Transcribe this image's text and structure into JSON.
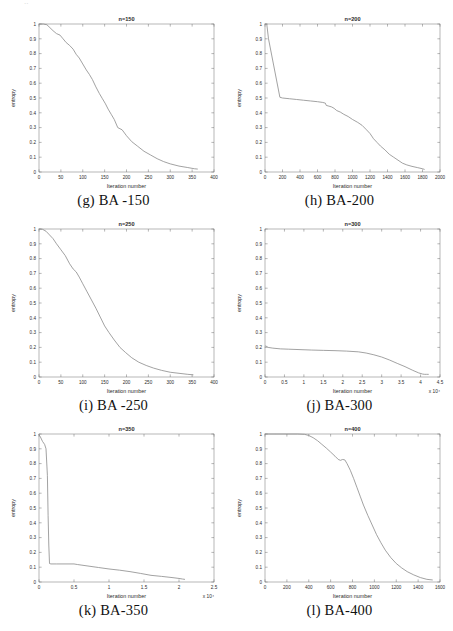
{
  "figure": {
    "artifact_text": "..",
    "panel_count": 6
  },
  "panels": [
    {
      "id": "g",
      "caption": "(g) BA -150",
      "title": "n=150",
      "xlabel": "Iteration number",
      "ylabel": "entropy",
      "x_exponent": "",
      "xticks": [
        "0",
        "50",
        "100",
        "150",
        "200",
        "250",
        "300",
        "350",
        "400"
      ],
      "yticks": [
        "0",
        "0.1",
        "0.2",
        "0.3",
        "0.4",
        "0.5",
        "0.6",
        "0.7",
        "0.8",
        "0.9",
        "1"
      ],
      "xlim": [
        0,
        400
      ],
      "ylim": [
        0,
        1
      ]
    },
    {
      "id": "h",
      "caption": "(h) BA-200",
      "title": "n=200",
      "xlabel": "Iteration number",
      "ylabel": "entropy",
      "x_exponent": "",
      "xticks": [
        "0",
        "200",
        "400",
        "600",
        "800",
        "1000",
        "1200",
        "1400",
        "1600",
        "1800",
        "2000"
      ],
      "yticks": [
        "0",
        "0.1",
        "0.2",
        "0.3",
        "0.4",
        "0.5",
        "0.6",
        "0.7",
        "0.8",
        "0.9",
        "1"
      ],
      "xlim": [
        0,
        2000
      ],
      "ylim": [
        0,
        1
      ]
    },
    {
      "id": "i",
      "caption": "(i) BA -250",
      "title": "n=250",
      "xlabel": "Iteration number",
      "ylabel": "entropy",
      "x_exponent": "",
      "xticks": [
        "0",
        "50",
        "100",
        "150",
        "200",
        "250",
        "300",
        "350",
        "400"
      ],
      "yticks": [
        "0",
        "0.1",
        "0.2",
        "0.3",
        "0.4",
        "0.5",
        "0.6",
        "0.7",
        "0.8",
        "0.9",
        "1"
      ],
      "xlim": [
        0,
        400
      ],
      "ylim": [
        0,
        1
      ]
    },
    {
      "id": "j",
      "caption": "(j) BA-300",
      "title": "n=300",
      "xlabel": "Iteration number",
      "ylabel": "entropy",
      "x_exponent": "x 10⁴",
      "xticks": [
        "0",
        "0.5",
        "1",
        "1.5",
        "2",
        "2.5",
        "3",
        "3.5",
        "4",
        "4.5"
      ],
      "yticks": [
        "0",
        "0.1",
        "0.2",
        "0.3",
        "0.4",
        "0.5",
        "0.6",
        "0.7",
        "0.8",
        "0.9",
        "1"
      ],
      "xlim": [
        0,
        4.5
      ],
      "ylim": [
        0,
        1
      ]
    },
    {
      "id": "k",
      "caption": "(k) BA-350",
      "title": "n=350",
      "xlabel": "Iteration number",
      "ylabel": "entropy",
      "x_exponent": "x 10⁴",
      "xticks": [
        "0",
        "0.5",
        "1",
        "1.5",
        "2",
        "2.5"
      ],
      "yticks": [
        "0",
        "0.1",
        "0.2",
        "0.3",
        "0.4",
        "0.5",
        "0.6",
        "0.7",
        "0.8",
        "0.9",
        "1"
      ],
      "xlim": [
        0,
        2.5
      ],
      "ylim": [
        0,
        1
      ]
    },
    {
      "id": "l",
      "caption": "(l) BA-400",
      "title": "n=400",
      "xlabel": "Iteration number",
      "ylabel": "entropy",
      "x_exponent": "",
      "xticks": [
        "0",
        "200",
        "400",
        "600",
        "800",
        "1000",
        "1200",
        "1400",
        "1600"
      ],
      "yticks": [
        "0",
        "0.1",
        "0.2",
        "0.3",
        "0.4",
        "0.5",
        "0.6",
        "0.7",
        "0.8",
        "0.9",
        "1"
      ],
      "xlim": [
        0,
        1600
      ],
      "ylim": [
        0,
        1
      ]
    }
  ],
  "chart_data": [
    {
      "type": "line",
      "panel": "g",
      "title": "n=150",
      "xlabel": "Iteration number",
      "ylabel": "entropy",
      "xlim": [
        0,
        400
      ],
      "ylim": [
        0,
        1
      ],
      "grid": false,
      "legend": null,
      "series": [
        {
          "name": "entropy",
          "x": [
            0,
            10,
            18,
            25,
            32,
            40,
            48,
            55,
            62,
            70,
            78,
            85,
            92,
            100,
            108,
            115,
            122,
            130,
            138,
            145,
            152,
            158,
            165,
            172,
            180,
            190,
            200,
            212,
            225,
            240,
            255,
            270,
            285,
            300,
            320,
            340,
            355,
            362
          ],
          "y": [
            1.0,
            1.0,
            0.995,
            0.975,
            0.955,
            0.935,
            0.925,
            0.9,
            0.875,
            0.855,
            0.83,
            0.795,
            0.77,
            0.73,
            0.69,
            0.66,
            0.625,
            0.575,
            0.53,
            0.495,
            0.46,
            0.425,
            0.39,
            0.355,
            0.3,
            0.285,
            0.245,
            0.205,
            0.175,
            0.14,
            0.115,
            0.09,
            0.07,
            0.055,
            0.04,
            0.03,
            0.022,
            0.02
          ]
        }
      ]
    },
    {
      "type": "line",
      "panel": "h",
      "title": "n=200",
      "xlabel": "Iteration number",
      "ylabel": "entropy",
      "xlim": [
        0,
        2000
      ],
      "ylim": [
        0,
        1
      ],
      "grid": false,
      "legend": null,
      "series": [
        {
          "name": "entropy",
          "x": [
            0,
            20,
            40,
            170,
            200,
            280,
            360,
            440,
            520,
            600,
            660,
            690,
            700,
            730,
            760,
            790,
            820,
            860,
            900,
            950,
            1000,
            1060,
            1110,
            1160,
            1200,
            1240,
            1280,
            1320,
            1370,
            1420,
            1470,
            1520,
            1570,
            1620,
            1680,
            1740,
            1800,
            1820
          ],
          "y": [
            1.0,
            1.0,
            0.9,
            0.505,
            0.5,
            0.495,
            0.49,
            0.485,
            0.48,
            0.475,
            0.47,
            0.465,
            0.45,
            0.445,
            0.44,
            0.43,
            0.415,
            0.405,
            0.39,
            0.375,
            0.355,
            0.335,
            0.315,
            0.285,
            0.26,
            0.225,
            0.2,
            0.175,
            0.15,
            0.12,
            0.1,
            0.08,
            0.06,
            0.048,
            0.038,
            0.03,
            0.022,
            0.018
          ]
        }
      ]
    },
    {
      "type": "line",
      "panel": "i",
      "title": "n=250",
      "xlabel": "Iteration number",
      "ylabel": "entropy",
      "xlim": [
        0,
        400
      ],
      "ylim": [
        0,
        1
      ],
      "grid": false,
      "legend": null,
      "series": [
        {
          "name": "entropy",
          "x": [
            0,
            8,
            16,
            24,
            32,
            40,
            50,
            60,
            70,
            78,
            85,
            92,
            100,
            110,
            120,
            130,
            140,
            150,
            160,
            172,
            185,
            198,
            212,
            228,
            245,
            262,
            280,
            300,
            320,
            340,
            352
          ],
          "y": [
            1.0,
            0.998,
            0.985,
            0.96,
            0.935,
            0.9,
            0.86,
            0.82,
            0.765,
            0.73,
            0.71,
            0.675,
            0.63,
            0.575,
            0.52,
            0.465,
            0.405,
            0.345,
            0.3,
            0.25,
            0.2,
            0.165,
            0.13,
            0.1,
            0.078,
            0.06,
            0.045,
            0.032,
            0.025,
            0.018,
            0.015
          ]
        }
      ]
    },
    {
      "type": "line",
      "panel": "j",
      "title": "n=300",
      "xlabel": "Iteration number",
      "ylabel": "entropy",
      "xlim": [
        0,
        4.5
      ],
      "ylim": [
        0,
        1
      ],
      "grid": false,
      "legend": null,
      "note": "x axis in units of 10^4",
      "series": [
        {
          "name": "entropy",
          "x": [
            0,
            0.02,
            0.08,
            0.2,
            0.4,
            0.6,
            0.9,
            1.2,
            1.5,
            1.8,
            2.1,
            2.4,
            2.6,
            2.8,
            3.0,
            3.2,
            3.4,
            3.6,
            3.8,
            3.95,
            4.05,
            4.1,
            4.15,
            4.2
          ],
          "y": [
            0.205,
            0.21,
            0.2,
            0.195,
            0.19,
            0.188,
            0.185,
            0.182,
            0.18,
            0.178,
            0.175,
            0.17,
            0.162,
            0.15,
            0.135,
            0.115,
            0.092,
            0.07,
            0.045,
            0.028,
            0.02,
            0.018,
            0.018,
            0.018
          ]
        }
      ]
    },
    {
      "type": "line",
      "panel": "k",
      "title": "n=350",
      "xlabel": "Iteration number",
      "ylabel": "entropy",
      "xlim": [
        0,
        2.5
      ],
      "ylim": [
        0,
        1
      ],
      "grid": false,
      "legend": null,
      "note": "x axis in units of 10^4",
      "series": [
        {
          "name": "entropy",
          "x": [
            0,
            0.02,
            0.05,
            0.08,
            0.1,
            0.12,
            0.13,
            0.14,
            0.15,
            0.17,
            0.25,
            0.4,
            0.5,
            0.55,
            0.7,
            0.85,
            1.0,
            1.15,
            1.3,
            1.45,
            1.6,
            1.75,
            1.9,
            2.0,
            2.05,
            2.08
          ],
          "y": [
            0.995,
            0.98,
            0.95,
            0.93,
            0.9,
            0.72,
            0.45,
            0.25,
            0.125,
            0.122,
            0.122,
            0.122,
            0.122,
            0.118,
            0.108,
            0.098,
            0.088,
            0.08,
            0.07,
            0.058,
            0.045,
            0.038,
            0.03,
            0.024,
            0.02,
            0.018
          ]
        }
      ]
    },
    {
      "type": "line",
      "panel": "l",
      "title": "n=400",
      "xlabel": "Iteration number",
      "ylabel": "entropy",
      "xlim": [
        0,
        1600
      ],
      "ylim": [
        0,
        1
      ],
      "grid": false,
      "legend": null,
      "series": [
        {
          "name": "entropy",
          "x": [
            0,
            100,
            200,
            300,
            360,
            400,
            440,
            480,
            520,
            560,
            600,
            640,
            670,
            690,
            710,
            730,
            750,
            780,
            810,
            840,
            870,
            900,
            940,
            980,
            1020,
            1060,
            1100,
            1150,
            1200,
            1250,
            1300,
            1360,
            1420,
            1480,
            1530
          ],
          "y": [
            1.0,
            1.0,
            1.0,
            1.0,
            0.998,
            0.99,
            0.975,
            0.955,
            0.93,
            0.905,
            0.878,
            0.85,
            0.828,
            0.822,
            0.828,
            0.825,
            0.8,
            0.755,
            0.7,
            0.64,
            0.58,
            0.52,
            0.45,
            0.385,
            0.32,
            0.265,
            0.215,
            0.165,
            0.125,
            0.095,
            0.07,
            0.048,
            0.03,
            0.018,
            0.014
          ]
        }
      ]
    }
  ]
}
